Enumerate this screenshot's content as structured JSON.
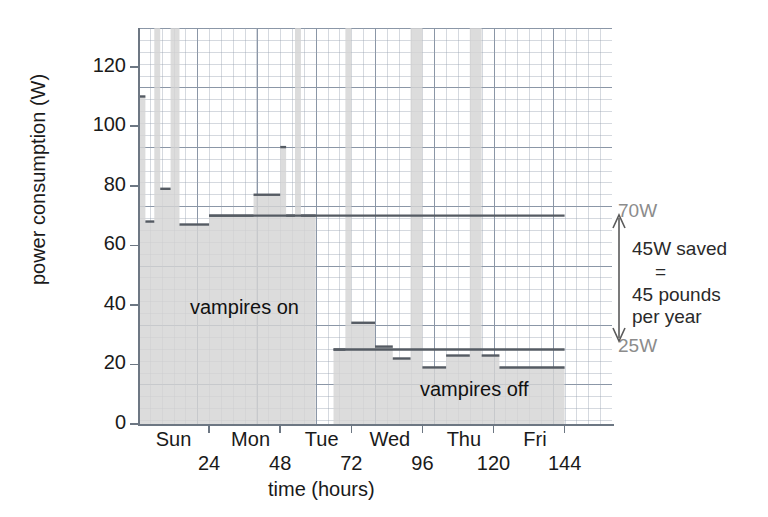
{
  "chart_data": {
    "type": "area",
    "title": "",
    "xlabel": "time (hours)",
    "ylabel": "power consumption (W)",
    "xlim": [
      0,
      160
    ],
    "ylim": [
      0,
      133
    ],
    "grid": true,
    "legend": "none",
    "y_ticks": [
      0,
      20,
      40,
      60,
      80,
      100,
      120
    ],
    "y_tick_labels": [
      "0",
      "20",
      "40",
      "60",
      "80",
      "100",
      "120"
    ],
    "x_ticks": [
      24,
      48,
      72,
      96,
      120,
      144
    ],
    "x_tick_labels": [
      "24",
      "48",
      "72",
      "96",
      "120",
      "144"
    ],
    "x_day_labels": [
      "Sun",
      "Mon",
      "Tue",
      "Wed",
      "Thu",
      "Fri"
    ],
    "x_day_positions": [
      12,
      38,
      62,
      85,
      110,
      134
    ],
    "series": [
      {
        "name": "vampires on",
        "note": "step/area series, baseline 0W, hours 0-60",
        "steps": [
          {
            "x0": 0,
            "x1": 2.5,
            "y": 110
          },
          {
            "x0": 2.5,
            "x1": 5.5,
            "y": 68
          },
          {
            "x0": 5.5,
            "x1": 7.5,
            "y": 133
          },
          {
            "x0": 7.5,
            "x1": 11,
            "y": 79
          },
          {
            "x0": 11,
            "x1": 14,
            "y": 133
          },
          {
            "x0": 14,
            "x1": 24,
            "y": 67
          },
          {
            "x0": 24,
            "x1": 39,
            "y": 70
          },
          {
            "x0": 39,
            "x1": 48,
            "y": 77
          },
          {
            "x0": 48,
            "x1": 50,
            "y": 93
          },
          {
            "x0": 50,
            "x1": 53,
            "y": 70
          },
          {
            "x0": 53,
            "x1": 55,
            "y": 133
          },
          {
            "x0": 55,
            "x1": 60,
            "y": 70
          }
        ]
      },
      {
        "name": "vampires off",
        "note": "step/area series, baseline 0W, hours 70-144",
        "steps": [
          {
            "x0": 66,
            "x1": 70,
            "y": 25
          },
          {
            "x0": 70,
            "x1": 72,
            "y": 133
          },
          {
            "x0": 72,
            "x1": 80,
            "y": 34
          },
          {
            "x0": 80,
            "x1": 86,
            "y": 26
          },
          {
            "x0": 86,
            "x1": 92,
            "y": 22
          },
          {
            "x0": 92,
            "x1": 96,
            "y": 133
          },
          {
            "x0": 96,
            "x1": 104,
            "y": 19
          },
          {
            "x0": 104,
            "x1": 112,
            "y": 23
          },
          {
            "x0": 112,
            "x1": 116,
            "y": 133
          },
          {
            "x0": 116,
            "x1": 122,
            "y": 23
          },
          {
            "x0": 122,
            "x1": 144,
            "y": 19
          }
        ]
      }
    ],
    "reference_lines": [
      {
        "label": "70W",
        "value": 70,
        "x_from": 24,
        "x_to": 144
      },
      {
        "label": "25W",
        "value": 25,
        "x_from": 66,
        "x_to": 144
      }
    ],
    "annotations": [
      {
        "name": "saved-arrow",
        "text_lines": [
          "45W saved",
          "=",
          "45 pounds",
          "per year"
        ],
        "from": 70,
        "to": 25
      },
      {
        "name": "region-on",
        "text": "vampires on"
      },
      {
        "name": "region-off",
        "text": "vampires off"
      }
    ]
  },
  "colors": {
    "fill": "#d4d4d4",
    "stroke": "#555b63",
    "grid_major": "#6e7d91",
    "grid_minor": "#96a0af",
    "axis": "#6d7783",
    "ref_label": "#8c8c8c",
    "text": "#1a1a1a"
  }
}
